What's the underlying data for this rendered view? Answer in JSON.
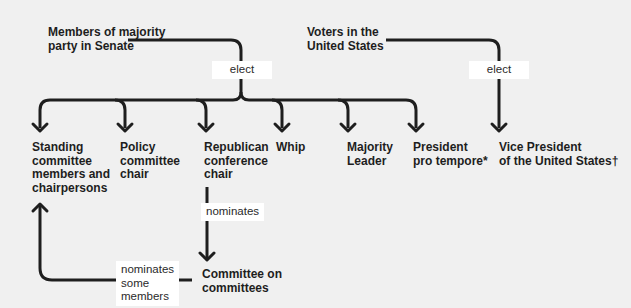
{
  "sources": {
    "senate_majority": "Members of majority\nparty in Senate",
    "voters": "Voters in the\nUnited States"
  },
  "edge_labels": {
    "senate_elect": "elect",
    "voters_elect": "elect",
    "conference_nominates": "nominates",
    "committee_nominates": "nominates\nsome\nmembers"
  },
  "targets": [
    {
      "id": "standing",
      "label": "Standing\ncommittee\nmembers and\nchairpersons"
    },
    {
      "id": "policy",
      "label": "Policy\ncommittee\nchair"
    },
    {
      "id": "republican",
      "label": "Republican\nconference\nchair"
    },
    {
      "id": "whip",
      "label": "Whip"
    },
    {
      "id": "majority",
      "label": "Majority\nLeader"
    },
    {
      "id": "ppt",
      "label": "President\npro tempore*"
    },
    {
      "id": "vp",
      "label": "Vice President\nof the United States†"
    }
  ],
  "committee": {
    "label": "Committee on\ncommittees"
  },
  "colors": {
    "line": "#1e1e1e",
    "background": "#f0f0f0",
    "label_bg": "#ffffff"
  }
}
